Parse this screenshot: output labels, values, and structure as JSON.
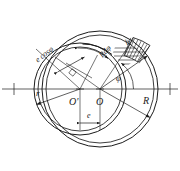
{
  "figure": {
    "background_color": "#ffffff",
    "line_color": "#1b1b1b",
    "axis": {
      "name": "horizontal-centerline",
      "y": 89,
      "x_start": 2,
      "x_end": 178,
      "tick_left_x": 14,
      "tick_right_x": 170
    },
    "circles": [
      {
        "name": "outer-bush-circle",
        "label_ref": "R",
        "cx": 100,
        "cy": 89,
        "r": 58
      },
      {
        "name": "outer-bush-circle-inner-wall",
        "label_ref": "R",
        "cx": 100,
        "cy": 89,
        "r": 54
      },
      {
        "name": "journal-circle",
        "label_ref": "r",
        "cx": 80,
        "cy": 89,
        "r": 46
      },
      {
        "name": "journal-circle-inner-wall",
        "label_ref": "r",
        "cx": 80,
        "cy": 89,
        "r": 42
      }
    ],
    "centers": [
      {
        "name": "journal-center",
        "label": "O'",
        "x": 80,
        "y": 89
      },
      {
        "name": "bush-center",
        "label": "O",
        "x": 100,
        "y": 89
      }
    ]
  },
  "labels": {
    "small_radius": "r",
    "large_radius": "R",
    "eccentricity": "e",
    "journal_center": "O'",
    "bush_center": "O",
    "angle": "φ",
    "arc_element": "Rdφ",
    "projection": "e cosφ",
    "wedge_thickness": "b"
  },
  "label_positions": {
    "small_radius": {
      "x": 36,
      "y": 95
    },
    "large_radius": {
      "x": 144,
      "y": 102
    },
    "eccentricity": {
      "x": 88,
      "y": 128
    },
    "journal_center": {
      "x": 70,
      "y": 103
    },
    "bush_center": {
      "x": 97,
      "y": 103
    },
    "angle": {
      "x": 117,
      "y": 82
    },
    "arc_element": {
      "x": 99,
      "y": 62,
      "rotation": -48
    },
    "projection": {
      "x": 36,
      "y": 60,
      "rotation": -38
    },
    "wedge_thickness": {
      "x": 124,
      "y": 44,
      "rotation": -30
    }
  },
  "annotations": {
    "angle_name": "phi-angle-arc",
    "hatched_wedge_name": "hatched-pressure-wedge",
    "right_angle_marker_name": "right-angle-square",
    "eccentricity_dimension_name": "eccentricity-dimension-line"
  },
  "geometry_values": {
    "phi_start_deg": 0,
    "phi_end_deg": 55,
    "wedge_start_deg": 40,
    "wedge_end_deg": 70,
    "eccentricity_px": 20
  }
}
